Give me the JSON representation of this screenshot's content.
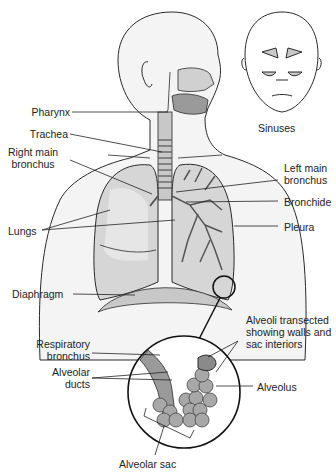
{
  "diagram": {
    "labels": {
      "pharynx": "Pharynx",
      "trachea": "Trachea",
      "right_main_bronchus_1": "Right main",
      "right_main_bronchus_2": "bronchus",
      "lungs": "Lungs",
      "diaphragm": "Diaphragm",
      "sinuses": "Sinuses",
      "left_main_bronchus_1": "Left main",
      "left_main_bronchus_2": "bronchus",
      "bronchide": "Bronchide",
      "pleura": "Pleura",
      "alveoli_transected_1": "Alveoli transected",
      "alveoli_transected_2": "showing walls and",
      "alveoli_transected_3": "sac interiors",
      "respiratory_bronchus_1": "Respiratory",
      "respiratory_bronchus_2": "bronchus",
      "alveolar_ducts_1": "Alveolar",
      "alveolar_ducts_2": "ducts",
      "alveolus": "Alveolus",
      "alveolar_sac": "Alveolar sac"
    },
    "colors": {
      "outline": "#2a2a2a",
      "body_fill": "#f4f4f4",
      "lung_fill": "#d6d6d6",
      "lung_light": "#e6e6e6",
      "airway_fill": "#9a9a9a",
      "alveoli_fill": "#a8a8a8"
    }
  }
}
